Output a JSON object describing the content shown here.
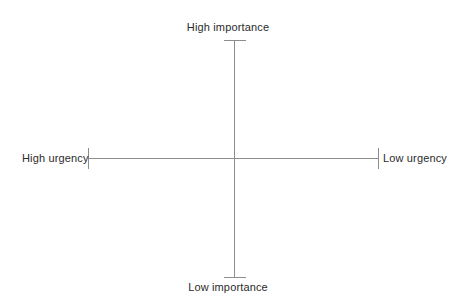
{
  "diagram": {
    "type": "two-axis-quadrant-matrix",
    "title": "",
    "background_color": "#ffffff",
    "line_color": "#8d8d8d",
    "text_color": "#2b2b2b",
    "axes": {
      "vertical": {
        "name": "importance",
        "top_label": "High importance",
        "bottom_label": "Low importance"
      },
      "horizontal": {
        "name": "urgency",
        "left_label": "High urgency",
        "right_label": "Low urgency"
      }
    },
    "labels": {
      "high_importance": "High importance",
      "low_importance": "Low importance",
      "high_urgency": "High urgency",
      "low_urgency": "Low urgency"
    }
  }
}
